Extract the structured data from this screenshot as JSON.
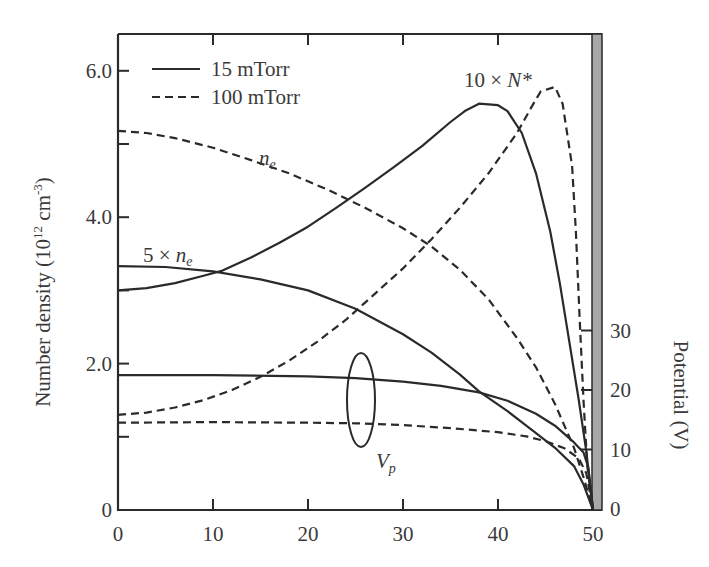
{
  "chart_data": {
    "type": "line",
    "title": "",
    "xlabel": "",
    "ylabel": "Number density (10^12 cm^-3)",
    "ylabel_parts": {
      "main": "Number density (10",
      "sup1": "12",
      "mid": " cm",
      "sup2": "-3",
      "end": ")"
    },
    "y2label": "Potential (V)",
    "xlim": [
      0,
      50
    ],
    "ylim": [
      0,
      6.5
    ],
    "y2lim": [
      0,
      85
    ],
    "x_ticks": [
      0,
      10,
      20,
      30,
      40,
      50
    ],
    "x_tick_labels": [
      "0",
      "10",
      "20",
      "30",
      "40",
      "50"
    ],
    "y_ticks": [
      0,
      2.0,
      4.0,
      6.0
    ],
    "y_tick_labels": [
      "0",
      "2.0",
      "4.0",
      "6.0"
    ],
    "y_minor_ticks": [
      1.0,
      3.0,
      5.0
    ],
    "y2_ticks": [
      0,
      10,
      20,
      30
    ],
    "y2_tick_labels": [
      "0",
      "10",
      "20",
      "30"
    ],
    "grid": false,
    "legend": {
      "position": "upper-left",
      "entries": [
        {
          "label": "15 mTorr",
          "style": "solid"
        },
        {
          "label": "100 mTorr",
          "style": "dashed"
        }
      ]
    },
    "annotations": {
      "ne_dashed": {
        "base": "n",
        "sub": "e"
      },
      "ne_solid": {
        "prefix": "5 × ",
        "base": "n",
        "sub": "e"
      },
      "nstar": {
        "prefix": "10 × ",
        "base": "N*"
      },
      "vp": {
        "base": "V",
        "sub": "p"
      }
    },
    "wall_bar": {
      "x": 50,
      "color": "#a8a8a8"
    },
    "series": [
      {
        "name": "5 × n_e (15 mTorr)",
        "style": "solid",
        "axis": "left",
        "x": [
          0,
          5,
          10,
          15,
          20,
          25,
          30,
          33,
          36,
          38,
          41,
          44,
          46,
          48,
          49,
          50
        ],
        "y": [
          3.33,
          3.32,
          3.26,
          3.15,
          3.0,
          2.75,
          2.4,
          2.15,
          1.85,
          1.62,
          1.35,
          1.05,
          0.85,
          0.6,
          0.35,
          0.0
        ]
      },
      {
        "name": "10 × N* (15 mTorr)",
        "style": "solid",
        "axis": "left",
        "x": [
          0,
          3,
          6,
          9,
          11,
          14,
          17,
          20,
          23,
          26,
          29,
          32,
          35,
          36.5,
          38,
          40,
          41,
          42.5,
          44,
          45.5,
          46.5,
          47.5,
          48.5,
          49.3,
          50
        ],
        "y": [
          3.0,
          3.03,
          3.1,
          3.2,
          3.27,
          3.45,
          3.65,
          3.87,
          4.13,
          4.4,
          4.68,
          4.97,
          5.3,
          5.45,
          5.55,
          5.53,
          5.45,
          5.15,
          4.6,
          3.8,
          3.1,
          2.3,
          1.5,
          0.8,
          0.0
        ]
      },
      {
        "name": "n_e (100 mTorr)",
        "style": "dashed",
        "axis": "left",
        "x": [
          0,
          3,
          6,
          10,
          14,
          18,
          22,
          26,
          30,
          33,
          36,
          39,
          42,
          44,
          46,
          48,
          49,
          50
        ],
        "y": [
          5.18,
          5.15,
          5.08,
          4.95,
          4.78,
          4.6,
          4.38,
          4.13,
          3.85,
          3.6,
          3.28,
          2.88,
          2.35,
          1.95,
          1.45,
          0.85,
          0.45,
          0.0
        ]
      },
      {
        "name": "10 × N* (100 mTorr)",
        "style": "dashed",
        "axis": "left",
        "x": [
          0,
          3,
          6,
          9,
          12,
          15,
          18,
          21,
          24,
          27,
          30,
          33,
          36,
          39,
          42,
          43.5,
          44.5,
          46,
          46.8,
          47.8,
          48.2,
          48.6,
          49,
          49.4,
          50
        ],
        "y": [
          1.3,
          1.33,
          1.4,
          1.5,
          1.64,
          1.82,
          2.04,
          2.3,
          2.6,
          2.95,
          3.3,
          3.7,
          4.13,
          4.6,
          5.15,
          5.5,
          5.72,
          5.78,
          5.55,
          4.7,
          3.8,
          2.6,
          1.5,
          0.6,
          0.0
        ]
      },
      {
        "name": "V_p (15 mTorr)",
        "style": "solid",
        "axis": "right",
        "x": [
          0,
          10,
          20,
          25,
          30,
          34,
          38,
          41,
          44,
          46,
          48,
          49,
          49.5,
          50
        ],
        "y": [
          22.5,
          22.5,
          22.3,
          22.0,
          21.4,
          20.7,
          19.6,
          18.2,
          16.0,
          14.0,
          11.2,
          9.5,
          7.0,
          0.0
        ]
      },
      {
        "name": "V_p (100 mTorr)",
        "style": "dashed",
        "axis": "right",
        "x": [
          0,
          10,
          20,
          25,
          30,
          35,
          40,
          43,
          45,
          47,
          48.5,
          49.3,
          50
        ],
        "y": [
          14.5,
          14.6,
          14.5,
          14.4,
          14.1,
          13.6,
          12.9,
          12.2,
          11.4,
          10.2,
          8.5,
          6.0,
          0.0
        ]
      }
    ]
  },
  "layout": {
    "plot_left": 118,
    "plot_right": 593,
    "plot_top": 34,
    "plot_bottom": 510,
    "x_px_per_unit": 9.5,
    "y_px_per_unit": 73.2,
    "y2_zero_px": 509,
    "y2_px_per_unit": 5.95,
    "vp_ellipse": {
      "cx": 361,
      "cy": 400,
      "rx": 14,
      "ry": 47
    }
  }
}
